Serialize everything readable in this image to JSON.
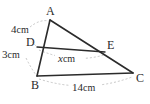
{
  "figure": {
    "background_color": "#ffffff",
    "line_color": "#2b2b2b",
    "dash_color": "#b3b3b3",
    "vertices": [
      {
        "id": "A",
        "label": "A",
        "x": 50,
        "y": 20
      },
      {
        "id": "B",
        "label": "B",
        "x": 37,
        "y": 76
      },
      {
        "id": "C",
        "label": "C",
        "x": 133,
        "y": 73
      },
      {
        "id": "D",
        "label": "D",
        "x": 37,
        "y": 47
      },
      {
        "id": "E",
        "label": "E",
        "x": 105,
        "y": 52
      }
    ],
    "segments": [
      {
        "id": "AB",
        "from": "A",
        "to": "B"
      },
      {
        "id": "AC",
        "from": "A",
        "to": "C"
      },
      {
        "id": "BC",
        "from": "B",
        "to": "C"
      },
      {
        "id": "DE",
        "from": "D",
        "to": "E"
      }
    ],
    "measurements": [
      {
        "id": "AD",
        "value": "4",
        "unit": "cm",
        "text": "4cm",
        "segment": "AD"
      },
      {
        "id": "DB",
        "value": "3",
        "unit": "cm",
        "text": "3cm",
        "segment": "DB"
      },
      {
        "id": "DE",
        "value": "x",
        "unit": "cm",
        "text": "x cm",
        "segment": "DE",
        "is_variable": true
      },
      {
        "id": "BC",
        "value": "14",
        "unit": "cm",
        "text": "14cm",
        "segment": "BC"
      }
    ]
  },
  "labels": {
    "A": "A",
    "B": "B",
    "C": "C",
    "D": "D",
    "E": "E",
    "ad_value": "4",
    "ad_unit": "cm",
    "db_value": "3",
    "db_unit": "cm",
    "de_value": "x",
    "de_unit": "cm",
    "bc_value": "14",
    "bc_unit": "cm"
  }
}
